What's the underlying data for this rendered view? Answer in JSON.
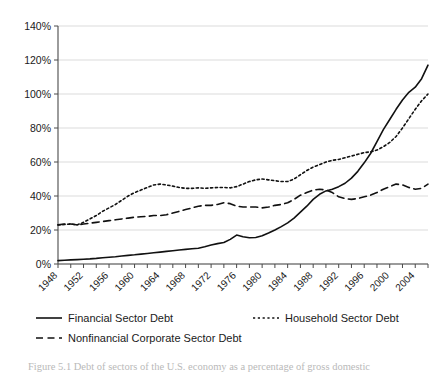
{
  "figure": {
    "caption": "Figure 5.1   Debt of sectors of the U.S. economy as a percentage of gross domestic"
  },
  "legend": {
    "items": [
      {
        "label": "Financial Sector Debt",
        "style": "solid"
      },
      {
        "label": "Household Sector Debt",
        "style": "dotted"
      },
      {
        "label": "Nonfinancial Corporate Sector Debt",
        "style": "dashed"
      }
    ]
  },
  "chart_data": {
    "type": "line",
    "title": "",
    "xlabel": "",
    "ylabel": "",
    "xlim": [
      1948,
      2006
    ],
    "ylim": [
      0,
      140
    ],
    "grid": true,
    "legend_position": "bottom",
    "ytick_labels": [
      "0%",
      "20%",
      "40%",
      "60%",
      "80%",
      "100%",
      "120%",
      "140%"
    ],
    "ytick_values": [
      0,
      20,
      40,
      60,
      80,
      100,
      120,
      140
    ],
    "xtick_labels": [
      "1948",
      "1952",
      "1956",
      "1960",
      "1964",
      "1968",
      "1972",
      "1976",
      "1980",
      "1984",
      "1988",
      "1992",
      "1996",
      "2000",
      "2004"
    ],
    "xtick_values": [
      1948,
      1952,
      1956,
      1960,
      1964,
      1968,
      1972,
      1976,
      1980,
      1984,
      1988,
      1992,
      1996,
      2000,
      2004
    ],
    "x": [
      1948,
      1949,
      1950,
      1951,
      1952,
      1953,
      1954,
      1955,
      1956,
      1957,
      1958,
      1959,
      1960,
      1961,
      1962,
      1963,
      1964,
      1965,
      1966,
      1967,
      1968,
      1969,
      1970,
      1971,
      1972,
      1973,
      1974,
      1975,
      1976,
      1977,
      1978,
      1979,
      1980,
      1981,
      1982,
      1983,
      1984,
      1985,
      1986,
      1987,
      1988,
      1989,
      1990,
      1991,
      1992,
      1993,
      1994,
      1995,
      1996,
      1997,
      1998,
      1999,
      2000,
      2001,
      2002,
      2003,
      2004,
      2005,
      2006
    ],
    "series": [
      {
        "name": "Financial Sector Debt",
        "style": "solid",
        "values": [
          2.0,
          2.2,
          2.4,
          2.6,
          2.8,
          3.0,
          3.3,
          3.7,
          4.0,
          4.3,
          4.7,
          5.1,
          5.4,
          5.8,
          6.2,
          6.6,
          7.0,
          7.4,
          7.8,
          8.2,
          8.6,
          9.0,
          9.3,
          10.2,
          11.2,
          12.0,
          12.6,
          14.5,
          17.0,
          16.0,
          15.4,
          15.6,
          16.6,
          18.2,
          20.0,
          22.0,
          24.2,
          27.0,
          30.5,
          34.0,
          38.0,
          41.0,
          43.0,
          44.0,
          45.5,
          47.5,
          50.5,
          54.5,
          59.5,
          65.0,
          72.0,
          79.0,
          85.0,
          91.0,
          96.5,
          101.0,
          104.0,
          109.0,
          117.0
        ]
      },
      {
        "name": "Household Sector Debt",
        "style": "dotted",
        "values": [
          23.0,
          23.2,
          23.5,
          23.0,
          24.5,
          26.5,
          28.5,
          31.0,
          33.0,
          35.0,
          37.5,
          40.0,
          42.0,
          43.5,
          45.0,
          46.5,
          47.0,
          46.5,
          45.8,
          45.0,
          44.5,
          44.5,
          44.8,
          44.5,
          44.8,
          45.0,
          45.0,
          44.8,
          45.5,
          47.0,
          48.5,
          49.5,
          50.0,
          49.5,
          49.0,
          48.5,
          48.5,
          50.0,
          52.5,
          55.0,
          57.0,
          58.5,
          60.0,
          61.0,
          61.5,
          62.5,
          63.5,
          64.5,
          65.5,
          66.0,
          67.0,
          69.0,
          71.5,
          75.0,
          80.0,
          85.5,
          91.0,
          96.0,
          100.0
        ]
      },
      {
        "name": "Nonfinancial Corporate Sector Debt",
        "style": "dashed",
        "values": [
          23.0,
          23.5,
          23.5,
          23.0,
          23.5,
          24.0,
          24.5,
          25.0,
          25.5,
          26.0,
          26.5,
          27.0,
          27.5,
          27.8,
          28.0,
          28.5,
          28.5,
          29.0,
          30.0,
          31.0,
          32.0,
          33.0,
          34.0,
          34.5,
          34.5,
          35.0,
          36.0,
          35.5,
          34.0,
          33.5,
          33.5,
          33.5,
          33.0,
          33.5,
          34.5,
          35.0,
          36.0,
          38.0,
          40.5,
          42.0,
          43.5,
          44.0,
          43.5,
          42.0,
          39.5,
          38.5,
          38.0,
          38.5,
          39.5,
          40.5,
          42.0,
          44.0,
          45.5,
          47.0,
          46.5,
          45.0,
          44.0,
          44.5,
          47.0
        ]
      }
    ]
  }
}
